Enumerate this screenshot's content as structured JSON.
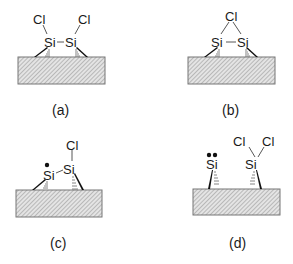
{
  "figure": {
    "panels": [
      {
        "id": "a",
        "label": "(a)",
        "atoms": {
          "si_left": "Si",
          "si_right": "Si",
          "cl_left": "Cl",
          "cl_right": "Cl"
        },
        "radical_dots_left": 0
      },
      {
        "id": "b",
        "label": "(b)",
        "atoms": {
          "si_left": "Si",
          "si_right": "Si",
          "cl_bridge": "Cl"
        },
        "radical_dots_left": 0
      },
      {
        "id": "c",
        "label": "(c)",
        "atoms": {
          "si_left": "Si",
          "si_right": "Si",
          "cl_right": "Cl"
        },
        "radical_dots_left": 1
      },
      {
        "id": "d",
        "label": "(d)",
        "atoms": {
          "si_left": "Si",
          "si_right": "Si",
          "cl_right_a": "Cl",
          "cl_right_b": "Cl"
        },
        "radical_dots_left": 2
      }
    ]
  }
}
